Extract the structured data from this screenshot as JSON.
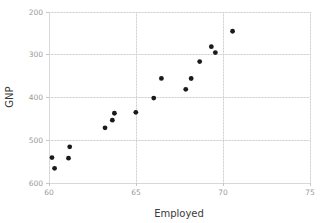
{
  "chart_data": {
    "type": "scatter",
    "title": "",
    "xlabel": "Employed",
    "ylabel": "GNP",
    "xlim": [
      60,
      75
    ],
    "ylim": [
      200,
      600
    ],
    "xticks": [
      60,
      65,
      70,
      75
    ],
    "yticks": [
      200,
      300,
      400,
      500,
      600
    ],
    "grid": true,
    "legend": null,
    "marker": {
      "shape": "circle",
      "color": "#1a1a1a",
      "size": 2.4
    },
    "series": [
      {
        "name": "GNP vs Employed",
        "points": [
          {
            "x": 60.32,
            "y": 234.3
          },
          {
            "x": 60.17,
            "y": 259.4
          },
          {
            "x": 61.12,
            "y": 258.1
          },
          {
            "x": 61.19,
            "y": 284.6
          },
          {
            "x": 63.22,
            "y": 328.98
          },
          {
            "x": 63.64,
            "y": 347.0
          },
          {
            "x": 63.76,
            "y": 363.1
          },
          {
            "x": 64.99,
            "y": 365.4
          },
          {
            "x": 66.02,
            "y": 398.6
          },
          {
            "x": 66.46,
            "y": 444.6
          },
          {
            "x": 67.86,
            "y": 419.2
          },
          {
            "x": 68.17,
            "y": 444.5
          },
          {
            "x": 68.66,
            "y": 484.0
          },
          {
            "x": 69.33,
            "y": 519.0
          },
          {
            "x": 69.56,
            "y": 505.0
          },
          {
            "x": 70.55,
            "y": 555.0
          }
        ]
      }
    ]
  },
  "axes": {
    "y_title": "GNP",
    "x_title": "Employed",
    "y_tick_labels": [
      "600",
      "500",
      "400",
      "300",
      "200"
    ],
    "x_tick_labels": [
      "60",
      "65",
      "70",
      "75"
    ]
  },
  "colors": {
    "marker": "#1a1a1a",
    "grid_major": "#e3e3e3",
    "grid_dotted": "#cfcfcf",
    "axis": "#d8d8d8",
    "tick_text": "#9a9a9a",
    "label_text": "#3a3a3a",
    "background": "#ffffff"
  }
}
